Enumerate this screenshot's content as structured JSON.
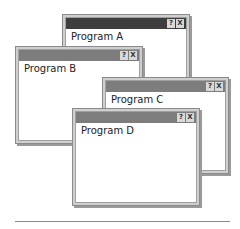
{
  "windows": [
    {
      "id": "a",
      "title": "Program A",
      "active": true,
      "help_label": "?",
      "close_label": "X"
    },
    {
      "id": "b",
      "title": "Program B",
      "active": false,
      "help_label": "?",
      "close_label": "X"
    },
    {
      "id": "c",
      "title": "Program C",
      "active": false,
      "help_label": "?",
      "close_label": "X"
    },
    {
      "id": "d",
      "title": "Program D",
      "active": false,
      "help_label": "?",
      "close_label": "X"
    }
  ],
  "colors": {
    "active_titlebar": "#3e3e3e",
    "inactive_titlebar": "#7d7d7d",
    "window_border": "#8a8a8a"
  }
}
